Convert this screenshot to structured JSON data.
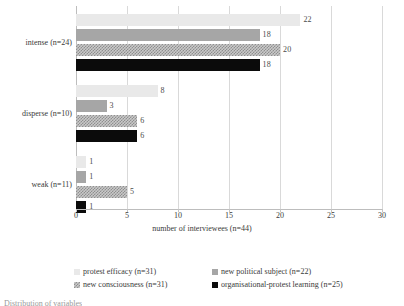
{
  "chart_data": {
    "type": "bar",
    "orientation": "horizontal",
    "title": "",
    "xlabel": "number of interviewees  (n=44)",
    "ylabel": "",
    "xlim": [
      0,
      30
    ],
    "xticks": [
      0,
      5,
      10,
      15,
      20,
      25,
      30
    ],
    "grid": true,
    "legend_position": "bottom",
    "categories": [
      "intense (n=24)",
      "disperse (n=10)",
      "weak (n=11)"
    ],
    "series": [
      {
        "name": "protest efficacy (n=31)",
        "color": "#e9e9e9",
        "values": [
          22,
          8,
          1
        ]
      },
      {
        "name": "new political subject (n=22)",
        "color": "#a6a6a6",
        "values": [
          18,
          3,
          1
        ]
      },
      {
        "name": "new consciousness (n=31)",
        "color": "#c9c9c9",
        "values": [
          20,
          6,
          5
        ]
      },
      {
        "name": "organisational-protest learning (n=25)",
        "color": "#0b0b0b",
        "values": [
          18,
          6,
          1
        ]
      }
    ]
  },
  "legend": {
    "entries": [
      "protest efficacy (n=31)",
      "new political subject (n=22)",
      "new consciousness (n=31)",
      "organisational-protest learning (n=25)"
    ]
  },
  "caption": {
    "text": "Distribution of variables"
  }
}
